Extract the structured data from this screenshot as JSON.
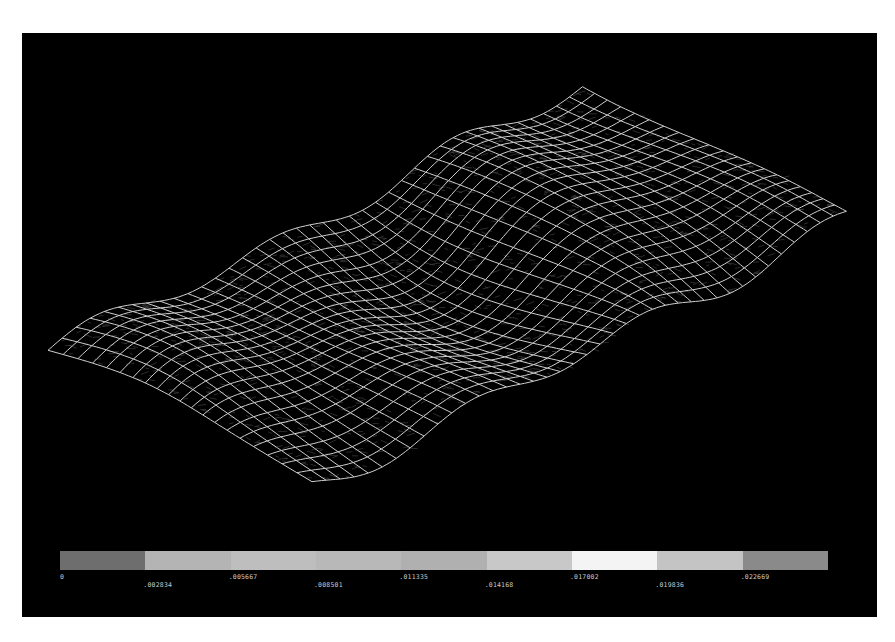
{
  "viewport": {
    "background": "#000000",
    "mesh_color": "#e6e6e6"
  },
  "mesh": {
    "origin": [
      26,
      319
    ],
    "u_vector": [
      539,
      -267
    ],
    "v_vector": [
      264,
      134
    ],
    "u_cells": 40,
    "v_cells": 20
  },
  "legend": {
    "colors": [
      "#6e6e6e",
      "#b4b4b4",
      "#bebebe",
      "#b8b8b8",
      "#b0b0b0",
      "#c8c8c8",
      "#f4f4f4",
      "#c4c4c4",
      "#8a8a8a"
    ],
    "labels": [
      {
        "text": "0",
        "row": 0
      },
      {
        "text": ".002834",
        "row": 1
      },
      {
        "text": ".005667",
        "row": 0
      },
      {
        "text": ".008501",
        "row": 1
      },
      {
        "text": ".011335",
        "row": 0
      },
      {
        "text": ".014168",
        "row": 1
      },
      {
        "text": ".017002",
        "row": 0
      },
      {
        "text": ".019836",
        "row": 1
      },
      {
        "text": ".022669",
        "row": 0
      }
    ]
  }
}
